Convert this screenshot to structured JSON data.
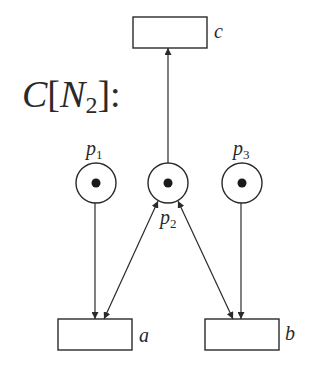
{
  "diagram": {
    "title": {
      "prefix": "C",
      "open": "[",
      "name": "N",
      "sub": "2",
      "close": "]",
      "suffix": ":"
    },
    "places": [
      {
        "id": "p1",
        "label": "p",
        "sub": "1",
        "cx": 96,
        "cy": 183,
        "r": 20,
        "tokens": 1
      },
      {
        "id": "p2",
        "label": "p",
        "sub": "2",
        "cx": 168,
        "cy": 183,
        "r": 20,
        "tokens": 1
      },
      {
        "id": "p3",
        "label": "p",
        "sub": "3",
        "cx": 242,
        "cy": 183,
        "r": 20,
        "tokens": 1
      }
    ],
    "transitions": [
      {
        "id": "c",
        "label": "c",
        "x": 133,
        "y": 17,
        "w": 74,
        "h": 31
      },
      {
        "id": "a",
        "label": "a",
        "x": 58,
        "y": 319,
        "w": 74,
        "h": 31
      },
      {
        "id": "b",
        "label": "b",
        "x": 205,
        "y": 319,
        "w": 74,
        "h": 31
      }
    ],
    "arcs": [
      {
        "from": "p2",
        "to": "c",
        "type": "arrow"
      },
      {
        "from": "p1",
        "to": "a",
        "type": "arrow"
      },
      {
        "from": "p3",
        "to": "b",
        "type": "arrow"
      },
      {
        "from": "a",
        "to": "p2",
        "type": "bidirectional"
      },
      {
        "from": "b",
        "to": "p2",
        "type": "bidirectional"
      }
    ],
    "colors": {
      "stroke": "#2a2a2a",
      "background": "#ffffff"
    }
  }
}
